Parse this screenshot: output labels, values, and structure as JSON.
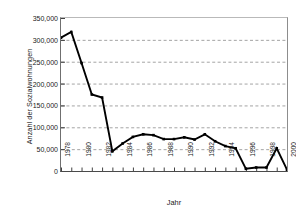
{
  "chart_data": {
    "type": "line",
    "title": "",
    "xlabel": "Jahr",
    "ylabel": "Anzahl der Sozialwohnungen",
    "xlim": [
      1978,
      2000
    ],
    "ylim": [
      0,
      350000
    ],
    "grid": "horizontal-dashed",
    "legend": "none",
    "marker": "square",
    "line_color": "#000000",
    "grid_color": "#9a9a9a",
    "ytick_labels": [
      "350,000",
      "300,000",
      "250,000",
      "200,000",
      "150,000",
      "100,000",
      "50,000",
      "0"
    ],
    "ytick_values": [
      350000,
      300000,
      250000,
      200000,
      150000,
      100000,
      50000,
      0
    ],
    "xtick_labels": [
      "1978",
      "1980",
      "1982",
      "1984",
      "1986",
      "1988",
      "1990",
      "1992",
      "1994",
      "1996",
      "1998",
      "2000"
    ],
    "xtick_values": [
      1978,
      1980,
      1982,
      1984,
      1986,
      1988,
      1990,
      1992,
      1994,
      1996,
      1998,
      2000
    ],
    "x": [
      1978,
      1979,
      1980,
      1981,
      1982,
      1983,
      1984,
      1985,
      1986,
      1987,
      1988,
      1989,
      1990,
      1991,
      1992,
      1993,
      1994,
      1995,
      1996,
      1997,
      1998,
      1999,
      2000
    ],
    "values": [
      305000,
      318000,
      247000,
      175000,
      168000,
      45000,
      63000,
      78000,
      84000,
      82000,
      73000,
      73000,
      77000,
      72000,
      84000,
      68000,
      57000,
      52000,
      5000,
      8000,
      8000,
      52000,
      3000
    ],
    "categories": [
      "1978",
      "1979",
      "1980",
      "1981",
      "1982",
      "1983",
      "1984",
      "1985",
      "1986",
      "1987",
      "1988",
      "1989",
      "1990",
      "1991",
      "1992",
      "1993",
      "1994",
      "1995",
      "1996",
      "1997",
      "1998",
      "1999",
      "2000"
    ]
  }
}
